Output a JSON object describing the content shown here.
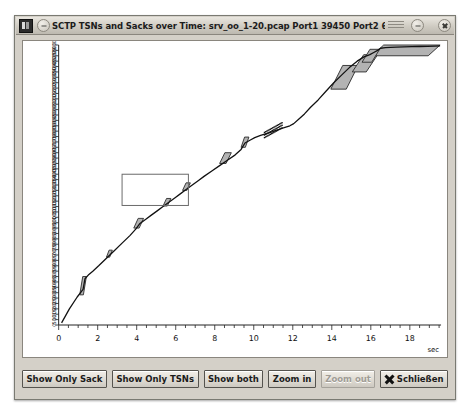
{
  "window": {
    "title": "SCTP TSNs and Sacks over Time: srv_oo_1-20.pcap Port1 39450 Port2 6001 Endpoint 1 <2>",
    "app_icon": "sctp-graph-icon",
    "minimize_label": "−",
    "close_label": "×"
  },
  "buttons": [
    {
      "label": "Show Only Sack",
      "name": "show-only-sack-button",
      "disabled": false
    },
    {
      "label": "Show Only TSNs",
      "name": "show-only-tsns-button",
      "disabled": false
    },
    {
      "label": "Show both",
      "name": "show-both-button",
      "disabled": false
    },
    {
      "label": "Zoom in",
      "name": "zoom-in-button",
      "disabled": false
    },
    {
      "label": "Zoom out",
      "name": "zoom-out-button",
      "disabled": true
    },
    {
      "label": "Schließen",
      "name": "close-dialog-button",
      "disabled": false
    }
  ],
  "colors": {
    "window_face": "#d4d0c8",
    "plot_background": "#ffffff",
    "line": "#111111",
    "sack_fill": "#b3b3b3",
    "sack_stroke": "#2b2b2b",
    "selection_stroke": "#6a6a6a",
    "axis": "#222222"
  },
  "chart_data": {
    "type": "line",
    "title": "SCTP TSNs and Sacks over Time",
    "xlabel": "sec",
    "ylabel": "",
    "grid": false,
    "legend": "none",
    "xlim": [
      0,
      19.6
    ],
    "ylim": [
      0,
      26000
    ],
    "x_ticks": [
      0,
      2,
      4,
      6,
      8,
      10,
      12,
      14,
      16,
      18
    ],
    "x_tick_labels": [
      "0",
      "2",
      "4",
      "6",
      "8",
      "10",
      "12",
      "14",
      "16",
      "18"
    ],
    "x_minor_step": 0.5,
    "y_tick_step": 500,
    "y_ticks": [
      0,
      500,
      1000,
      1500,
      2000,
      2500,
      3000,
      3500,
      4000,
      4500,
      5000,
      5500,
      6000,
      6500,
      7000,
      7500,
      8000,
      8500,
      9000,
      9500,
      10000,
      10500,
      11000,
      11500,
      12000,
      12500,
      13000,
      13500,
      14000,
      14500,
      15000,
      15500,
      16000,
      16500,
      17000,
      17500,
      18000,
      18500,
      19000,
      19500,
      20000,
      20500,
      21000,
      21500,
      22000,
      22500,
      23000,
      23500,
      24000,
      24500,
      25000,
      25500,
      26000
    ],
    "series": [
      {
        "name": "TSN",
        "style": "line-with-markers",
        "x": [
          0.15,
          0.55,
          0.95,
          1.25,
          1.35,
          1.55,
          1.75,
          2.05,
          2.45,
          2.85,
          3.25,
          3.65,
          3.95,
          4.15,
          4.45,
          4.75,
          5.05,
          5.35,
          5.65,
          5.95,
          6.25,
          6.55,
          6.85,
          7.15,
          7.45,
          7.85,
          8.25,
          8.65,
          9.05,
          9.35,
          9.55,
          9.85,
          10.05,
          10.35,
          10.6,
          10.9,
          11.1,
          11.35,
          11.6,
          11.85,
          12.05,
          12.3,
          12.6,
          12.9,
          13.3,
          13.7,
          14.1,
          14.5,
          14.9,
          15.3,
          15.65,
          15.95,
          16.15,
          16.35,
          16.5,
          16.75,
          17.0,
          17.3,
          17.7,
          18.1,
          18.5,
          18.9,
          19.3,
          19.55
        ],
        "y": [
          200,
          1500,
          2600,
          3300,
          4300,
          4700,
          5000,
          5500,
          6200,
          6900,
          7600,
          8300,
          8900,
          9400,
          9800,
          10200,
          10600,
          11000,
          11400,
          11800,
          12200,
          12600,
          13000,
          13400,
          13800,
          14300,
          14800,
          15300,
          15800,
          16300,
          16900,
          17200,
          17400,
          17600,
          17750,
          17900,
          18050,
          18200,
          18350,
          18500,
          18700,
          19100,
          19600,
          20200,
          20900,
          21700,
          22500,
          23200,
          23900,
          24500,
          24900,
          25100,
          25300,
          25500,
          25700,
          25750,
          25780,
          25800,
          25820,
          25840,
          25860,
          25880,
          25900,
          25920
        ]
      }
    ],
    "sack_blocks": [
      {
        "x0": 1.08,
        "x1": 1.42,
        "y0": 2800,
        "y1": 4500
      },
      {
        "x0": 2.45,
        "x1": 2.75,
        "y0": 6300,
        "y1": 6950
      },
      {
        "x0": 3.85,
        "x1": 4.35,
        "y0": 9000,
        "y1": 9900
      },
      {
        "x0": 5.35,
        "x1": 5.75,
        "y0": 11050,
        "y1": 11750
      },
      {
        "x0": 6.35,
        "x1": 6.75,
        "y0": 12500,
        "y1": 13200
      },
      {
        "x0": 8.25,
        "x1": 8.85,
        "y0": 15000,
        "y1": 16000
      },
      {
        "x0": 9.35,
        "x1": 9.75,
        "y0": 16500,
        "y1": 17450
      },
      {
        "x0": 13.95,
        "x1": 15.35,
        "y0": 21900,
        "y1": 24100
      },
      {
        "x0": 15.05,
        "x1": 16.35,
        "y0": 23500,
        "y1": 25100
      },
      {
        "x0": 16.05,
        "x1": 19.55,
        "y0": 25000,
        "y1": 26000
      },
      {
        "x0": 15.55,
        "x1": 16.45,
        "y0": 24400,
        "y1": 25600
      }
    ],
    "gap_segment": {
      "x0": 10.55,
      "x1": 11.45,
      "note": "dotted sack gap region"
    },
    "selection_rect": {
      "x0": 3.25,
      "x1": 6.65,
      "y0": 11100,
      "y1": 14000
    },
    "annotations": []
  }
}
